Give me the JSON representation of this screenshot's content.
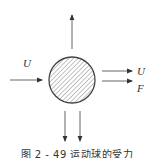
{
  "figure": {
    "caption": "图 2 - 49   运动球的受力",
    "colors": {
      "stroke": "#444444",
      "hatch": "#777777",
      "text": "#333333",
      "background": "#ffffff"
    },
    "body": {
      "shape": "circle",
      "fill": "hatched",
      "center": [
        72,
        80
      ],
      "radius": 23
    },
    "labels": {
      "incoming_velocity": "U",
      "outgoing_velocity": "U",
      "force": "F"
    },
    "arrows": [
      {
        "name": "incoming-flow",
        "direction": "right",
        "from": [
          10,
          80
        ],
        "to": [
          42,
          80
        ]
      },
      {
        "name": "upward",
        "direction": "up",
        "from": [
          72,
          49
        ],
        "to": [
          72,
          15
        ]
      },
      {
        "name": "outgoing-velocity",
        "direction": "right",
        "from": [
          102,
          71
        ],
        "to": [
          132,
          71
        ]
      },
      {
        "name": "force",
        "direction": "right",
        "from": [
          102,
          81
        ],
        "to": [
          132,
          81
        ]
      },
      {
        "name": "downward-left",
        "direction": "down",
        "from": [
          65,
          111
        ],
        "to": [
          65,
          141
        ]
      },
      {
        "name": "downward-right",
        "direction": "down",
        "from": [
          80,
          111
        ],
        "to": [
          80,
          141
        ]
      }
    ]
  }
}
